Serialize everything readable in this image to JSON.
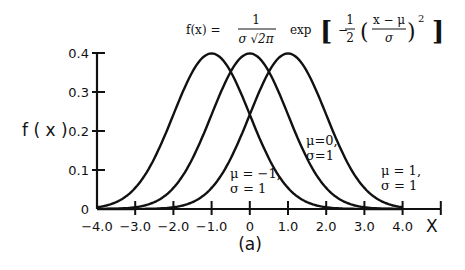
{
  "chart_data": {
    "type": "line",
    "formula": {
      "lhs": "f(x) =",
      "frac_num": "1",
      "frac_den": "σ √2π",
      "exp": "exp",
      "inner_minus": "−",
      "half_num": "1",
      "half_den": "2",
      "frac2_num": "x − μ",
      "frac2_den": "σ",
      "power": "2"
    },
    "xlabel": "X",
    "ylabel": "f ( x )",
    "caption": "(a)",
    "xlim": [
      -4.0,
      5.0
    ],
    "ylim": [
      0,
      0.4
    ],
    "x_ticks": [
      -4.0,
      -3.0,
      -2.0,
      -1.0,
      0,
      1.0,
      2.0,
      3.0,
      4.0,
      5.0
    ],
    "x_tick_labels": [
      "-4.0",
      "-3.0",
      "-2.0",
      "-1.0",
      "0",
      "1.0",
      "2.0",
      "3.0",
      "4.0",
      ""
    ],
    "y_ticks": [
      0,
      0.1,
      0.2,
      0.3,
      0.4
    ],
    "y_tick_labels": [
      "0",
      "0.1",
      "0.2",
      "0.3",
      "0.4"
    ],
    "grid": false,
    "legend": "none (inline annotations)",
    "series": [
      {
        "name": "μ = −1, σ = 1",
        "mu": -1,
        "sigma": 1,
        "x": [
          -4,
          -3,
          -2,
          -1,
          0,
          1,
          2,
          3,
          4
        ],
        "values": [
          0.004,
          0.054,
          0.242,
          0.399,
          0.242,
          0.054,
          0.004,
          0.0001,
          0.0
        ]
      },
      {
        "name": "μ = 0, σ = 1",
        "mu": 0,
        "sigma": 1,
        "x": [
          -4,
          -3,
          -2,
          -1,
          0,
          1,
          2,
          3,
          4
        ],
        "values": [
          0.0001,
          0.004,
          0.054,
          0.242,
          0.399,
          0.242,
          0.054,
          0.004,
          0.0001
        ]
      },
      {
        "name": "μ = 1, σ = 1",
        "mu": 1,
        "sigma": 1,
        "x": [
          -4,
          -3,
          -2,
          -1,
          0,
          1,
          2,
          3,
          4
        ],
        "values": [
          0.0,
          0.0001,
          0.004,
          0.054,
          0.242,
          0.399,
          0.242,
          0.054,
          0.004
        ]
      }
    ],
    "annotations": [
      {
        "line1": "μ  = −1,",
        "line2": "σ  = 1"
      },
      {
        "line1": "μ=0,",
        "line2": "σ=1"
      },
      {
        "line1": "μ  = 1,",
        "line2": "σ  = 1"
      }
    ]
  }
}
